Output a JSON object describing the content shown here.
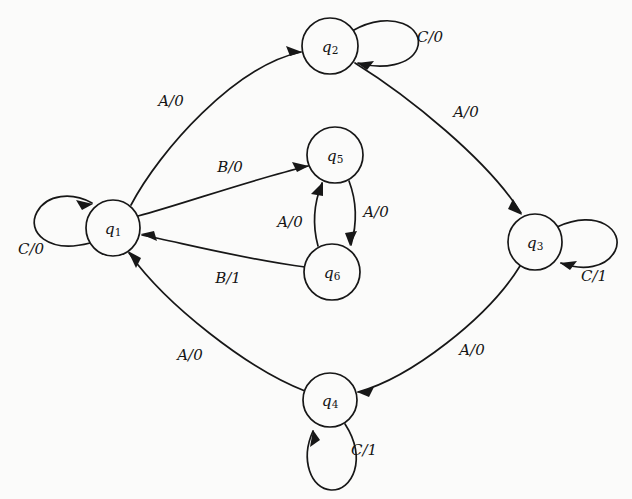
{
  "diagram": {
    "type": "finite-state-machine",
    "background_color": "#fbfbfa",
    "stroke_color": "#171717",
    "states": [
      {
        "id": "q1",
        "base": "q",
        "sub": "1",
        "cx": 113,
        "cy": 228,
        "r": 27
      },
      {
        "id": "q2",
        "base": "q",
        "sub": "2",
        "cx": 330,
        "cy": 46,
        "r": 28
      },
      {
        "id": "q3",
        "base": "q",
        "sub": "3",
        "cx": 535,
        "cy": 242,
        "r": 27
      },
      {
        "id": "q4",
        "base": "q",
        "sub": "4",
        "cx": 330,
        "cy": 400,
        "r": 27
      },
      {
        "id": "q5",
        "base": "q",
        "sub": "5",
        "cx": 335,
        "cy": 155,
        "r": 28
      },
      {
        "id": "q6",
        "base": "q",
        "sub": "6",
        "cx": 332,
        "cy": 272,
        "r": 28
      }
    ],
    "transitions": [
      {
        "from": "q1",
        "to": "q2",
        "input": "A",
        "output": "0",
        "label": "A/0",
        "lx": 171,
        "ly": 101
      },
      {
        "from": "q2",
        "to": "q2",
        "input": "C",
        "output": "0",
        "label": "C/0",
        "lx": 430,
        "ly": 37,
        "self_loop": true
      },
      {
        "from": "q2",
        "to": "q3",
        "input": "A",
        "output": "0",
        "label": "A/0",
        "lx": 466,
        "ly": 112
      },
      {
        "from": "q3",
        "to": "q3",
        "input": "C",
        "output": "1",
        "label": "C/1",
        "lx": 594,
        "ly": 276,
        "self_loop": true
      },
      {
        "from": "q3",
        "to": "q4",
        "input": "A",
        "output": "0",
        "label": "A/0",
        "lx": 472,
        "ly": 350
      },
      {
        "from": "q4",
        "to": "q4",
        "input": "C",
        "output": "1",
        "label": "C/1",
        "lx": 364,
        "ly": 450,
        "self_loop": true
      },
      {
        "from": "q4",
        "to": "q1",
        "input": "A",
        "output": "0",
        "label": "A/0",
        "lx": 190,
        "ly": 355
      },
      {
        "from": "q1",
        "to": "q1",
        "input": "C",
        "output": "0",
        "label": "C/0",
        "lx": 31,
        "ly": 249,
        "self_loop": true
      },
      {
        "from": "q1",
        "to": "q5",
        "input": "B",
        "output": "0",
        "label": "B/0",
        "lx": 230,
        "ly": 167
      },
      {
        "from": "q5",
        "to": "q6",
        "input": "A",
        "output": "0",
        "label": "A/0",
        "lx": 376,
        "ly": 212
      },
      {
        "from": "q6",
        "to": "q5",
        "input": "A",
        "output": "0",
        "label": "A/0",
        "lx": 290,
        "ly": 222
      },
      {
        "from": "q6",
        "to": "q1",
        "input": "B",
        "output": "1",
        "label": "B/1",
        "lx": 228,
        "ly": 278
      }
    ]
  }
}
